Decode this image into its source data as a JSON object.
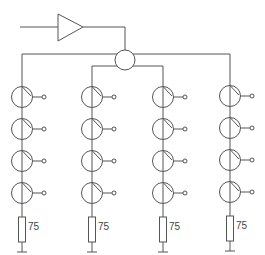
{
  "diagram": {
    "type": "cable distribution network (amplifier, splitter, tap chains)",
    "stroke_color": "#555555",
    "background": "#ffffff",
    "input_line": {
      "x1": 20,
      "y": 27,
      "x2": 58
    },
    "amplifier": {
      "left_x": 58,
      "top_y": 14,
      "bottom_y": 41,
      "apex_x": 83,
      "mid_y": 27
    },
    "amp_output": {
      "x_end": 125,
      "y": 27
    },
    "splitter": {
      "cx": 125,
      "cy": 60,
      "r": 10
    },
    "branches": {
      "outer_y": 54,
      "inner_y": 66
    },
    "columns": [
      {
        "id": "col-1",
        "x": 22,
        "feed": "outer",
        "taps": [
          97,
          129,
          161,
          193
        ],
        "terminator_label": "75"
      },
      {
        "id": "col-2",
        "x": 92,
        "feed": "inner",
        "taps": [
          97,
          129,
          161,
          193
        ],
        "terminator_label": "75"
      },
      {
        "id": "col-3",
        "x": 163,
        "feed": "inner",
        "taps": [
          97,
          129,
          161,
          193
        ],
        "terminator_label": "75"
      },
      {
        "id": "col-4",
        "x": 230,
        "feed": "outer",
        "taps": [
          96,
          128,
          160,
          192
        ],
        "terminator_label": "75"
      }
    ],
    "tap": {
      "r": 10.5,
      "port_offset": 22,
      "port_r": 2
    },
    "resistor": {
      "width": 7,
      "top_offset": 24,
      "height": 25
    },
    "ground": {
      "half_width": 5,
      "offset_below_resistor": 10
    }
  },
  "labels": {
    "terminator_1": "75",
    "terminator_2": "75",
    "terminator_3": "75",
    "terminator_4": "75"
  }
}
